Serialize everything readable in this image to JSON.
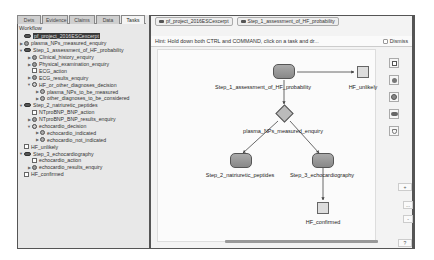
{
  "left_panel": {
    "tabs": [
      {
        "label": "Dets",
        "active": false
      },
      {
        "label": "Evidence",
        "active": false
      },
      {
        "label": "Claims",
        "active": false
      },
      {
        "label": "Data",
        "active": false
      },
      {
        "label": "Tasks",
        "active": true
      }
    ],
    "section_title": "Workflow",
    "tree": [
      {
        "label": "pf_project_2016ESCexcerpt",
        "type": "plan",
        "depth": 0,
        "expander": "",
        "selected": true
      },
      {
        "label": "plasma_NPs_measured_enquiry",
        "type": "enquiry",
        "depth": 0,
        "expander": "▶"
      },
      {
        "label": "Step_1_assessment_of_HF_probability",
        "type": "plan",
        "depth": 0,
        "expander": "▼"
      },
      {
        "label": "Clinical_history_enquiry",
        "type": "enquiry",
        "depth": 1,
        "expander": "▶"
      },
      {
        "label": "Physical_examination_enquiry",
        "type": "enquiry",
        "depth": 1,
        "expander": "▶"
      },
      {
        "label": "ECG_action",
        "type": "action",
        "depth": 1,
        "expander": ""
      },
      {
        "label": "ECG_results_enquiry",
        "type": "enquiry",
        "depth": 1,
        "expander": "▶"
      },
      {
        "label": "HF_or_other_diagnoses_decision",
        "type": "decision",
        "depth": 1,
        "expander": "▼"
      },
      {
        "label": "plasma_NPs_to_be_measured",
        "type": "candidate",
        "depth": 2,
        "expander": "▶"
      },
      {
        "label": "other_diagnoses_to_be_considered",
        "type": "candidate",
        "depth": 2,
        "expander": "▶"
      },
      {
        "label": "Step_2_natriuretic_peptides",
        "type": "plan",
        "depth": 0,
        "expander": "▼"
      },
      {
        "label": "NTproBNP_BNP_action",
        "type": "action",
        "depth": 1,
        "expander": ""
      },
      {
        "label": "NTproBNP_BNP_results_enquiry",
        "type": "enquiry",
        "depth": 1,
        "expander": "▶"
      },
      {
        "label": "echocardio_decision",
        "type": "decision",
        "depth": 1,
        "expander": "▼"
      },
      {
        "label": "echocardio_indicated",
        "type": "candidate",
        "depth": 2,
        "expander": "▶"
      },
      {
        "label": "echocardio_not_indicated",
        "type": "candidate",
        "depth": 2,
        "expander": "▶"
      },
      {
        "label": "HF_unlikely",
        "type": "action",
        "depth": 0,
        "expander": ""
      },
      {
        "label": "Step_3_echocardiography",
        "type": "plan",
        "depth": 0,
        "expander": "▼"
      },
      {
        "label": "echocardio_action",
        "type": "action",
        "depth": 1,
        "expander": ""
      },
      {
        "label": "echocardio_results_enquiry",
        "type": "enquiry",
        "depth": 1,
        "expander": "▶"
      },
      {
        "label": "HF_confirmed",
        "type": "action",
        "depth": 0,
        "expander": ""
      }
    ]
  },
  "breadcrumb": [
    {
      "label": "pf_project_2016ESCexcerpt"
    },
    {
      "label": "Step_1_assessment_of_HF_probability"
    }
  ],
  "hint": {
    "text": "Hint: Hold down both CTRL and COMMAND, click on a task and dr...",
    "dismiss_label": "Dismiss"
  },
  "graph": {
    "nodes": [
      {
        "id": "step1",
        "label": "Step_1_assessment_of_HF_probability",
        "type": "plan"
      },
      {
        "id": "hf_unlikely",
        "label": "HF_unlikely",
        "type": "action"
      },
      {
        "id": "plasma",
        "label": "plasma_NPs_measured_enquiry",
        "type": "decision"
      },
      {
        "id": "step2",
        "label": "Step_2_natriuretic_peptides",
        "type": "plan"
      },
      {
        "id": "step3",
        "label": "Step_3_echocardiography",
        "type": "plan"
      },
      {
        "id": "hf_confirmed",
        "label": "HF_confirmed",
        "type": "action"
      }
    ]
  },
  "toolbox": {
    "tools": [
      "action-tool",
      "enquiry-tool",
      "decision-tool",
      "plan-tool",
      "keystone-tool"
    ],
    "zoom_in": "+",
    "zoom_fit": "...",
    "zoom_out": "-",
    "help": "?"
  }
}
